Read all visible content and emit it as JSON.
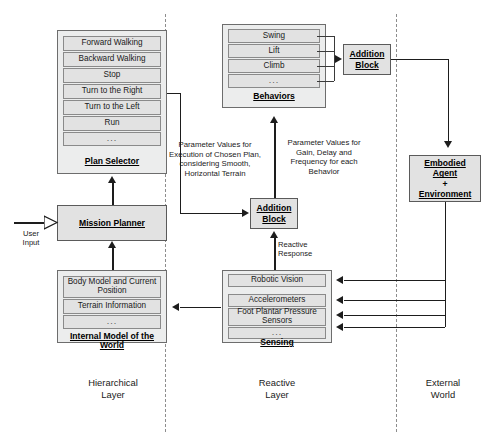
{
  "hierarchical_layer": {
    "label_line1": "Hierarchical",
    "label_line2": "Layer",
    "plan_selector": {
      "title": "Plan Selector",
      "items": [
        "Forward Walking",
        "Backward Walking",
        "Stop",
        "Turn to the Right",
        "Turn to the Left",
        "Run",
        "..."
      ]
    },
    "mission_planner": {
      "title": "Mission Planner"
    },
    "user_input": {
      "line1": "User",
      "line2": "Input"
    },
    "internal_model": {
      "title_line1": "Internal Model of the",
      "title_line2": "World",
      "items": [
        "Body Model and Current Position",
        "Terrain Information",
        "..."
      ]
    }
  },
  "reactive_layer": {
    "label_line1": "Reactive",
    "label_line2": "Layer",
    "behaviors": {
      "title": "Behaviors",
      "items": [
        "Swing",
        "Lift",
        "Climb",
        "..."
      ]
    },
    "behaviors_addition_block": {
      "line1": "Addition",
      "line2": "Block"
    },
    "central_addition_block": {
      "line1": "Addition",
      "line2": "Block"
    },
    "sensing": {
      "title": "Sensing",
      "items": [
        "Robotic Vision",
        "Accelerometers",
        "Foot Plantar Pressure Sensors",
        "..."
      ]
    }
  },
  "external_world": {
    "label_line1": "External",
    "label_line2": "World",
    "embodied_agent": {
      "line1": "Embodied",
      "line2": "Agent",
      "plus": "+",
      "line3": "Environment"
    }
  },
  "annotations": {
    "plan_parameters": "Parameter Values for Execution of Chosen Plan, considering Smooth, Horizontal Terrain",
    "behavior_parameters": "Parameter Values for Gain, Delay and Frequency for each Behavior",
    "reactive_response_line1": "Reactive",
    "reactive_response_line2": "Response"
  },
  "colors": {
    "group_fill": "#eceded",
    "cell_fill": "#e2e2e2",
    "border": "#6d6d6d",
    "line": "#1d1d1d",
    "divider": "#8d8d8d"
  }
}
